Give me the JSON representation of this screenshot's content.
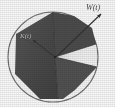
{
  "figure": {
    "kind": "geometric-diagram",
    "width": 115,
    "height": 107,
    "background_color": "#ffffff",
    "labels": {
      "outer": "W(t)",
      "inner": "K(t)"
    },
    "colors": {
      "polygon_fill": "#4a4a4a",
      "polygon_fill_dark": "#3c3c3c",
      "polygon_fill_light": "#585858",
      "circle_stroke": "#6e6e6e",
      "wedge_fill": "#f2f2f2",
      "leader_line": "#2e2e2e",
      "label_text": "#3d3d3d"
    },
    "circle": {
      "cx": 53,
      "cy": 57,
      "r": 45,
      "stroke_width": 1.1
    },
    "center_vertex": {
      "x": 55,
      "y": 57
    },
    "polygon_points": "53,12 16,34 15,74 40,99 63,99 97,67 96,44 55,57",
    "wedge_points": "55,57 96,44 97,67 63,99 58,99",
    "leader_lines": [
      {
        "name": "outer-leader",
        "x1": 56,
        "y1": 57,
        "x2": 101,
        "y2": 14,
        "label": "W(t)"
      },
      {
        "name": "inner-leader",
        "x1": 55,
        "y1": 57,
        "x2": 33,
        "y2": 40,
        "label": "K(t)"
      }
    ],
    "arrowheads": [
      {
        "name": "outer-arrowhead",
        "x": 101,
        "y": 14
      },
      {
        "name": "inner-arrowhead",
        "x": 33,
        "y": 40
      }
    ]
  }
}
